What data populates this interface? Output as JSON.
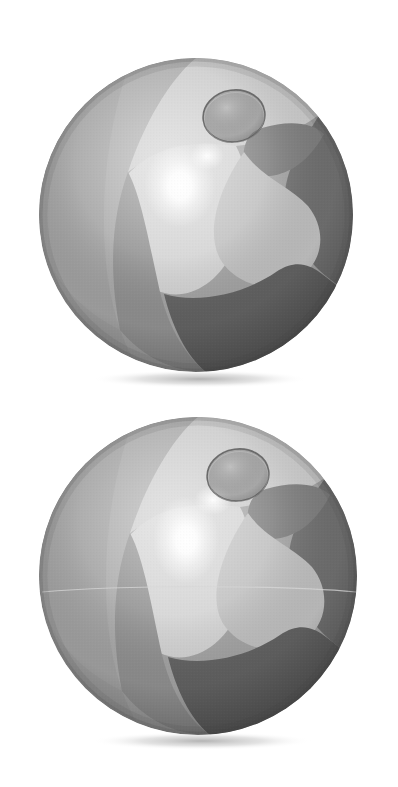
{
  "scene": {
    "title": "Two inflatable beach balls",
    "background_color": "#ffffff",
    "width": 398,
    "height": 787,
    "rendering": "grayscale photographic illustration, halftone print texture",
    "object_count": 2,
    "caption_top": "beach-ball-upper",
    "caption_bottom": "beach-ball-lower"
  },
  "palette": {
    "background": "#ffffff",
    "panel_light": "#d3d3d3",
    "panel_light_2": "#c2c2c2",
    "panel_mid": "#a8a8a8",
    "panel_mid_2": "#9a9a9a",
    "panel_dark": "#7d7d7d",
    "panel_darker": "#6a6a6a",
    "panel_deep": "#5c5c5c",
    "rim_shade": "#4f4f4f",
    "specular": "#ffffff",
    "valve_fill": "#8e8e8e",
    "valve_outline": "#5a5a5a",
    "ground_shadow": "#b9b9b9",
    "seam_line": "#c9c9c9"
  },
  "balls": [
    {
      "id": "beach-ball-upper",
      "label": "Upper beach ball",
      "center_x": 196,
      "center_y": 215,
      "radius": 157,
      "valve": {
        "label": "Inflation valve cap",
        "center_x": 234,
        "center_y": 116,
        "rx": 31,
        "ry": 26,
        "rotation": -8,
        "fill": "#8e8e8e",
        "outline": "#5a5a5a"
      },
      "specular_highlight": {
        "label": "Specular highlight",
        "center_x": 180,
        "center_y": 186,
        "rx": 34,
        "ry": 40,
        "intensity": 1.0
      },
      "secondary_highlight": {
        "center_x": 207,
        "center_y": 156,
        "rx": 16,
        "ry": 13
      },
      "ground_shadow": {
        "center_x": 200,
        "center_y": 379,
        "rx": 108,
        "ry": 9,
        "color": "#b9b9b9"
      },
      "panels": [
        {
          "name": "panel-top-left-mid",
          "tone": "#a4a4a4"
        },
        {
          "name": "panel-upper-light",
          "tone": "#cecece"
        },
        {
          "name": "panel-right-dark",
          "tone": "#6d6d6d"
        },
        {
          "name": "panel-lower-left-mid",
          "tone": "#8e8e8e"
        },
        {
          "name": "panel-lower-right-deep",
          "tone": "#5f5f5f"
        },
        {
          "name": "panel-center-light",
          "tone": "#c6c6c6"
        }
      ],
      "seam_visible": false
    },
    {
      "id": "beach-ball-lower",
      "label": "Lower beach ball",
      "center_x": 198,
      "center_y": 576,
      "radius": 159,
      "valve": {
        "label": "Inflation valve cap",
        "center_x": 238,
        "center_y": 475,
        "rx": 31,
        "ry": 26,
        "rotation": -8,
        "fill": "#8e8e8e",
        "outline": "#5a5a5a"
      },
      "specular_highlight": {
        "label": "Specular highlight",
        "center_x": 186,
        "center_y": 540,
        "rx": 32,
        "ry": 42,
        "intensity": 1.0
      },
      "secondary_highlight": {
        "center_x": 213,
        "center_y": 500,
        "rx": 18,
        "ry": 14
      },
      "ground_shadow": {
        "center_x": 202,
        "center_y": 741,
        "rx": 110,
        "ry": 9,
        "color": "#b9b9b9"
      },
      "panels": [
        {
          "name": "panel-top-left-mid",
          "tone": "#a4a4a4"
        },
        {
          "name": "panel-upper-light",
          "tone": "#cecece"
        },
        {
          "name": "panel-right-dark",
          "tone": "#6d6d6d"
        },
        {
          "name": "panel-lower-left-mid",
          "tone": "#8e8e8e"
        },
        {
          "name": "panel-lower-right-deep",
          "tone": "#5f5f5f"
        },
        {
          "name": "panel-center-light",
          "tone": "#c6c6c6"
        }
      ],
      "seam_visible": true,
      "seam_line": {
        "y": 591,
        "color": "#cfcfcf",
        "label": "Equator seam line"
      }
    }
  ]
}
